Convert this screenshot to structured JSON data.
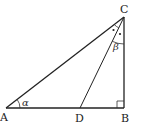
{
  "figure": {
    "type": "right-triangle-with-angle-bisector",
    "points": {
      "A": {
        "label": "A",
        "x": 6,
        "y": 108
      },
      "B": {
        "label": "B",
        "x": 124,
        "y": 108
      },
      "C": {
        "label": "C",
        "x": 124,
        "y": 17
      },
      "D": {
        "label": "D",
        "x": 80,
        "y": 108
      }
    },
    "segments": [
      "AB",
      "BC",
      "CA",
      "CD"
    ],
    "angles": {
      "alpha": {
        "label": "α",
        "vertex": "A"
      },
      "beta": {
        "label": "β",
        "vertex": "C",
        "between": "CD-CB"
      }
    },
    "right_angle_at": "B",
    "equal_angle_marks_at": "C",
    "colors": {
      "line": "#222222",
      "background": "#ffffff"
    }
  }
}
